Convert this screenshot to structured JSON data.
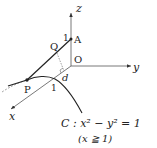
{
  "diagram": {
    "axes": {
      "x_label": "x",
      "y_label": "y",
      "z_label": "z",
      "origin_label": "O"
    },
    "points": {
      "A": {
        "label": "A",
        "z_value_label": "1"
      },
      "Q": {
        "label": "Q"
      },
      "P": {
        "label": "P"
      }
    },
    "x_axis_tick_label": "1",
    "distance_label": "d",
    "curve": {
      "name": "C",
      "equation_prefix": "C : ",
      "equation": "x² − y² = 1",
      "condition": "(x ≧ 1)"
    },
    "colors": {
      "line": "#333333",
      "dashed": "#888888",
      "text": "#222222"
    }
  }
}
